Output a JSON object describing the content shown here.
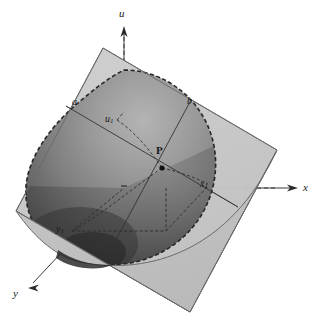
{
  "figure": {
    "kind": "3d-geometry-diagram",
    "background_color": "#ffffff"
  },
  "axes": {
    "u": {
      "label": "u",
      "x": 119,
      "y": 8
    },
    "x": {
      "label": "x",
      "x": 303,
      "y": 183
    },
    "y": {
      "label": "y",
      "x": 13,
      "y": 288
    },
    "origin": {
      "x": 124,
      "y": 188
    }
  },
  "points": {
    "a": {
      "label": "a",
      "sub": "",
      "x": 72,
      "y": 97
    },
    "b": {
      "label": "b",
      "sub": "",
      "x": 187,
      "y": 96
    },
    "u1": {
      "label": "u",
      "sub": "1",
      "x": 105,
      "y": 114
    },
    "P": {
      "label": "P",
      "sub": "",
      "x": 156,
      "y": 145
    },
    "x1": {
      "label": "x",
      "sub": "1",
      "x": 200,
      "y": 179
    },
    "y1": {
      "label": "y",
      "sub": "1",
      "x": 56,
      "y": 224
    }
  },
  "colors": {
    "sphere_light": "#a8a8a8",
    "sphere_mid": "#8c8c8c",
    "sphere_dark": "#5a5a5a",
    "sphere_darkest": "#3c3c3c",
    "plane_front": "#c6c6c6",
    "plane_back": "#bdbdbd",
    "outline": "#2b2b2b",
    "axis": "#3a3a3a",
    "label": "#1a1a1a"
  },
  "geometry": {
    "plane_corners": [
      {
        "x": 103,
        "y": 48
      },
      {
        "x": 277,
        "y": 150
      },
      {
        "x": 190,
        "y": 312
      },
      {
        "x": 16,
        "y": 211
      }
    ],
    "sphere_center": {
      "x": 124,
      "y": 188
    },
    "sphere_radius": 118,
    "point_P": {
      "x": 162,
      "y": 168
    }
  }
}
